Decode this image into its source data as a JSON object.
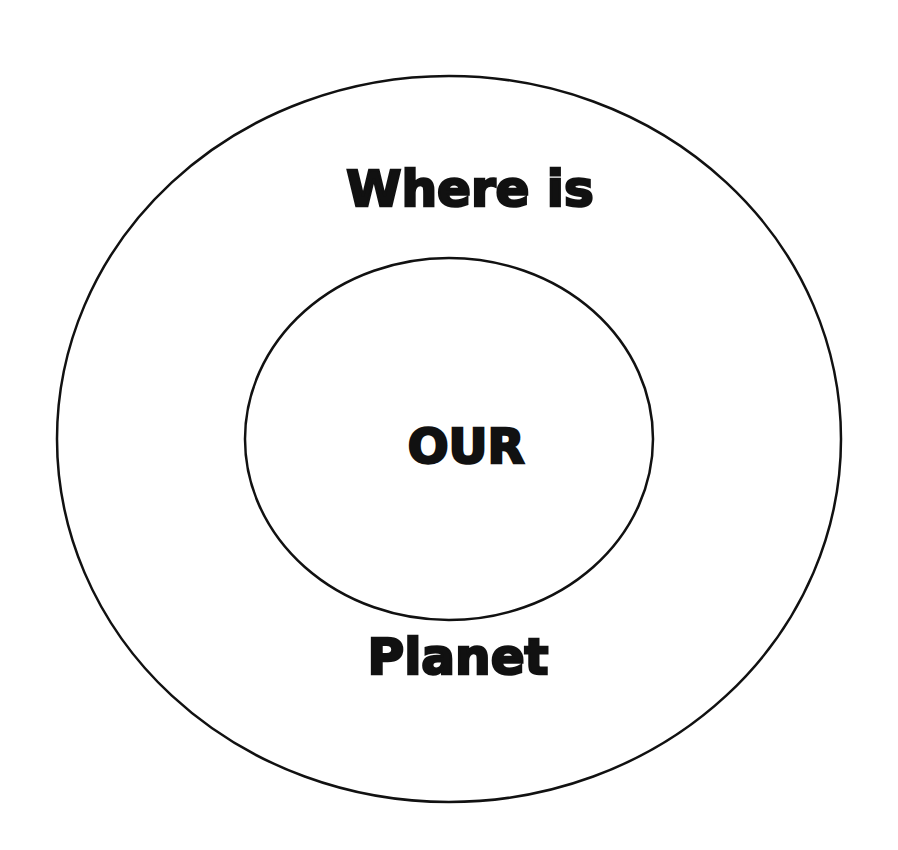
{
  "diagram": {
    "type": "concentric-circles",
    "colors": {
      "background": "#ffffff",
      "stroke": "#111111",
      "text": "#111111"
    },
    "outer_circle": {
      "cx": 449,
      "cy": 439,
      "rx": 392,
      "ry": 363
    },
    "inner_circle": {
      "cx": 449,
      "cy": 439,
      "rx": 204,
      "ry": 181
    },
    "labels": {
      "top": "Where is",
      "center": "OUR",
      "bottom": "Planet"
    }
  }
}
